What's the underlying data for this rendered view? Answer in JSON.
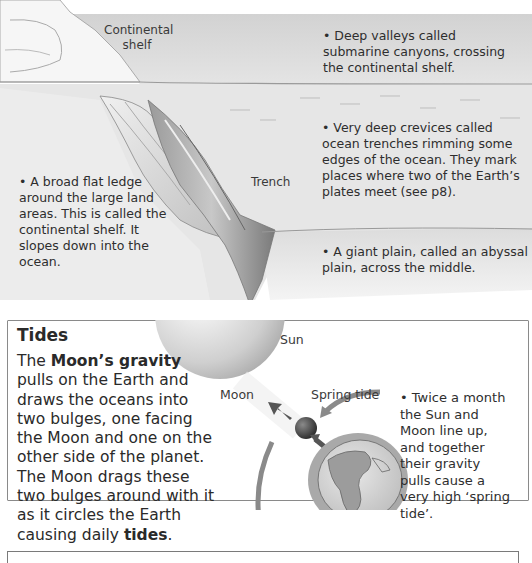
{
  "ocean_floor": {
    "labels": {
      "continental_shelf": "Continental shelf",
      "continental_shelf_line1": "Continental",
      "continental_shelf_line2": "shelf",
      "trench": "Trench"
    },
    "notes": [
      {
        "id": "submarine-canyons",
        "text": "• Deep valleys called submarine canyons, crossing the continental shelf."
      },
      {
        "id": "ocean-trenches",
        "text": "• Very deep crevices called ocean trenches rimming some edges of the ocean. They mark places where two of the Earth’s plates meet (see p8)."
      },
      {
        "id": "continental-shelf",
        "text": "• A broad flat ledge around the large land areas. This is called the continental shelf. It slopes down into the ocean."
      },
      {
        "id": "abyssal-plain",
        "text": "• A giant plain, called an abyssal plain, across the middle."
      }
    ]
  },
  "tides": {
    "title": "Tides",
    "body_bold_1": "Moon’s gravity",
    "body_pre": "The ",
    "body_mid": " pulls on the Earth and draws the oceans into two bulges, one facing the Moon and one on the other side of the planet. The Moon drags these two bulges around with it as it circles the Earth causing daily ",
    "body_bold_2": "tides",
    "body_end": ".",
    "diagram_labels": {
      "sun": "Sun",
      "moon": "Moon",
      "spring_tide": "Spring tide"
    },
    "spring_tide_note": "• Twice a month the Sun and Moon line up, and together their gravity pulls cause a very high ‘spring tide’."
  },
  "colors": {
    "sea": "#d8d8d8",
    "text": "#2a2a2a",
    "border": "#8a8a8a",
    "arrow": "#7a7a7a"
  }
}
